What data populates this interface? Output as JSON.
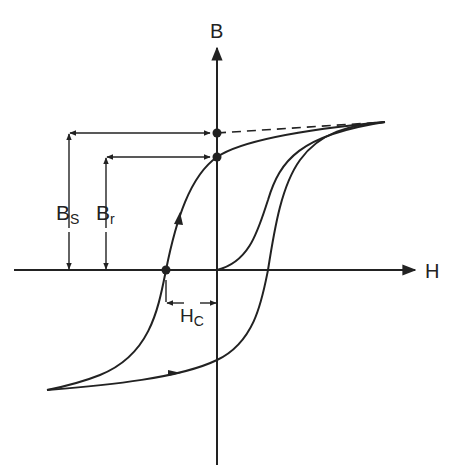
{
  "diagram": {
    "title": "",
    "type": "magnetic hysteresis loop (B-H curve)",
    "axes": {
      "x_label": "H",
      "y_label": "B"
    },
    "annotations": {
      "saturation": {
        "main": "B",
        "sub": "S"
      },
      "remanence": {
        "main": "B",
        "sub": "r"
      },
      "coercivity": {
        "main": "H",
        "sub": "C"
      }
    },
    "colors": {
      "line": "#222222",
      "background": "#ffffff"
    }
  }
}
